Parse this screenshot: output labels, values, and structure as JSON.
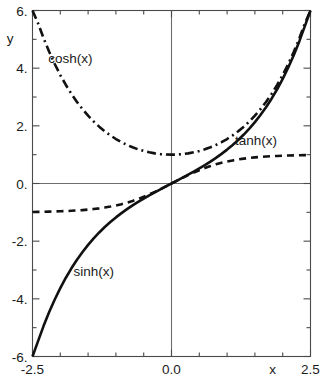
{
  "chart_data": {
    "type": "line",
    "title": "",
    "xlabel": "x",
    "ylabel": "y",
    "xlim": [
      -2.5,
      2.5
    ],
    "ylim": [
      -6,
      6
    ],
    "grid": false,
    "legend_position": "inline-annotations",
    "x_ticks": [
      {
        "value": -2.5,
        "label": "-2.5",
        "major": true
      },
      {
        "value": -2.0,
        "label": "",
        "major": false
      },
      {
        "value": -1.5,
        "label": "",
        "major": false
      },
      {
        "value": -1.0,
        "label": "",
        "major": false
      },
      {
        "value": -0.5,
        "label": "",
        "major": false
      },
      {
        "value": 0.0,
        "label": "0.0",
        "major": true
      },
      {
        "value": 0.5,
        "label": "",
        "major": false
      },
      {
        "value": 1.0,
        "label": "",
        "major": false
      },
      {
        "value": 1.5,
        "label": "",
        "major": false
      },
      {
        "value": 2.0,
        "label": "",
        "major": false
      },
      {
        "value": 2.5,
        "label": "2.5",
        "major": true
      }
    ],
    "y_ticks": [
      {
        "value": 6,
        "label": "6.",
        "major": true
      },
      {
        "value": 5,
        "label": "",
        "major": false
      },
      {
        "value": 4,
        "label": "4.",
        "major": true
      },
      {
        "value": 3,
        "label": "",
        "major": false
      },
      {
        "value": 2,
        "label": "2.",
        "major": true
      },
      {
        "value": 1,
        "label": "",
        "major": false
      },
      {
        "value": 0,
        "label": "0.",
        "major": true
      },
      {
        "value": -1,
        "label": "",
        "major": false
      },
      {
        "value": -2,
        "label": "-2.",
        "major": true
      },
      {
        "value": -3,
        "label": "",
        "major": false
      },
      {
        "value": -4,
        "label": "-4.",
        "major": true
      },
      {
        "value": -5,
        "label": "",
        "major": false
      },
      {
        "value": -6,
        "label": "-6.",
        "major": true
      }
    ],
    "series": [
      {
        "name": "sinh(x)",
        "style": "solid",
        "annotation": {
          "text": "sinh(x)",
          "x": -1.4,
          "y": -3.05
        },
        "x": [
          -2.5,
          -2.4,
          -2.3,
          -2.2,
          -2.1,
          -2.0,
          -1.9,
          -1.8,
          -1.7,
          -1.6,
          -1.5,
          -1.4,
          -1.3,
          -1.2,
          -1.1,
          -1.0,
          -0.9,
          -0.8,
          -0.7,
          -0.6,
          -0.5,
          -0.4,
          -0.3,
          -0.2,
          -0.1,
          0.0,
          0.1,
          0.2,
          0.3,
          0.4,
          0.5,
          0.6,
          0.7,
          0.8,
          0.9,
          1.0,
          1.1,
          1.2,
          1.3,
          1.4,
          1.5,
          1.6,
          1.7,
          1.8,
          1.9,
          2.0,
          2.1,
          2.2,
          2.3,
          2.4,
          2.5
        ],
        "values": [
          -6.0502,
          -5.4662,
          -4.937,
          -4.4571,
          -4.0219,
          -3.6269,
          -3.2682,
          -2.9422,
          -2.6456,
          -2.3756,
          -2.1293,
          -1.9043,
          -1.6984,
          -1.5095,
          -1.3356,
          -1.1752,
          -1.0265,
          -0.8881,
          -0.7586,
          -0.6367,
          -0.5211,
          -0.4108,
          -0.3045,
          -0.2013,
          -0.1002,
          0.0,
          0.1002,
          0.2013,
          0.3045,
          0.4108,
          0.5211,
          0.6367,
          0.7586,
          0.8881,
          1.0265,
          1.1752,
          1.3356,
          1.5095,
          1.6984,
          1.9043,
          2.1293,
          2.3756,
          2.6456,
          2.9422,
          3.2682,
          3.6269,
          4.0219,
          4.4571,
          4.937,
          5.4662,
          6.0502
        ]
      },
      {
        "name": "cosh(x)",
        "style": "dash-dot",
        "annotation": {
          "text": "cosh(x)",
          "x": -1.82,
          "y": 4.35
        },
        "x": [
          -2.5,
          -2.4,
          -2.3,
          -2.2,
          -2.1,
          -2.0,
          -1.9,
          -1.8,
          -1.7,
          -1.6,
          -1.5,
          -1.4,
          -1.3,
          -1.2,
          -1.1,
          -1.0,
          -0.9,
          -0.8,
          -0.7,
          -0.6,
          -0.5,
          -0.4,
          -0.3,
          -0.2,
          -0.1,
          0.0,
          0.1,
          0.2,
          0.3,
          0.4,
          0.5,
          0.6,
          0.7,
          0.8,
          0.9,
          1.0,
          1.1,
          1.2,
          1.3,
          1.4,
          1.5,
          1.6,
          1.7,
          1.8,
          1.9,
          2.0,
          2.1,
          2.2,
          2.3,
          2.4,
          2.5
        ],
        "values": [
          6.1323,
          5.5569,
          5.0372,
          4.5679,
          4.1443,
          3.7622,
          3.4177,
          3.1075,
          2.8283,
          2.5775,
          2.3524,
          2.1509,
          1.9709,
          1.8107,
          1.6685,
          1.5431,
          1.4331,
          1.3374,
          1.2552,
          1.1855,
          1.1276,
          1.0811,
          1.0453,
          1.0201,
          1.005,
          1.0,
          1.005,
          1.0201,
          1.0453,
          1.0811,
          1.1276,
          1.1855,
          1.2552,
          1.3374,
          1.4331,
          1.5431,
          1.6685,
          1.8107,
          1.9709,
          2.1509,
          2.3524,
          2.5775,
          2.8283,
          3.1075,
          3.4177,
          3.7622,
          4.1443,
          4.5679,
          5.0372,
          5.5569,
          6.1323
        ]
      },
      {
        "name": "tanh(x)",
        "style": "dashed",
        "annotation": {
          "text": "tanh(x)",
          "x": 1.52,
          "y": 1.52
        },
        "x": [
          -2.5,
          -2.4,
          -2.3,
          -2.2,
          -2.1,
          -2.0,
          -1.9,
          -1.8,
          -1.7,
          -1.6,
          -1.5,
          -1.4,
          -1.3,
          -1.2,
          -1.1,
          -1.0,
          -0.9,
          -0.8,
          -0.7,
          -0.6,
          -0.5,
          -0.4,
          -0.3,
          -0.2,
          -0.1,
          0.0,
          0.1,
          0.2,
          0.3,
          0.4,
          0.5,
          0.6,
          0.7,
          0.8,
          0.9,
          1.0,
          1.1,
          1.2,
          1.3,
          1.4,
          1.5,
          1.6,
          1.7,
          1.8,
          1.9,
          2.0,
          2.1,
          2.2,
          2.3,
          2.4,
          2.5
        ],
        "values": [
          -0.9866,
          -0.9837,
          -0.9801,
          -0.9757,
          -0.9705,
          -0.964,
          -0.9562,
          -0.9468,
          -0.9354,
          -0.9217,
          -0.9051,
          -0.8854,
          -0.8617,
          -0.8337,
          -0.8005,
          -0.7616,
          -0.7163,
          -0.664,
          -0.6044,
          -0.537,
          -0.4621,
          -0.3799,
          -0.2913,
          -0.1974,
          -0.0997,
          0.0,
          0.0997,
          0.1974,
          0.2913,
          0.3799,
          0.4621,
          0.537,
          0.6044,
          0.664,
          0.7163,
          0.7616,
          0.8005,
          0.8337,
          0.8617,
          0.8854,
          0.9051,
          0.9217,
          0.9354,
          0.9468,
          0.9562,
          0.964,
          0.9705,
          0.9757,
          0.9801,
          0.9837,
          0.9866
        ]
      }
    ],
    "colors": {
      "curve": "#111111",
      "frame": "#4a4a4a",
      "axis": "#6e6e6e",
      "text": "#1a1a1a",
      "background": "#ffffff"
    }
  }
}
